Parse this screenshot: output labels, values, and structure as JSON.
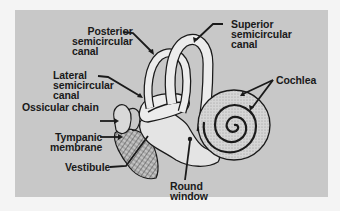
{
  "figure": {
    "background_color": "#c8c8c8",
    "line_color": "#1a1a1a"
  },
  "labels": {
    "posterior": [
      "Posterior",
      "semicircular",
      "canal"
    ],
    "superior": [
      "Superior",
      "semicircular",
      "canal"
    ],
    "lateral": [
      "Lateral",
      "semicircular",
      "canal"
    ],
    "ossicular": [
      "Ossicular chain"
    ],
    "cochlea": [
      "Cochlea"
    ],
    "tympanic": [
      "Tympanic",
      "membrane"
    ],
    "vestibule": [
      "Vestibule"
    ],
    "round_window": [
      "Round",
      "window"
    ]
  }
}
